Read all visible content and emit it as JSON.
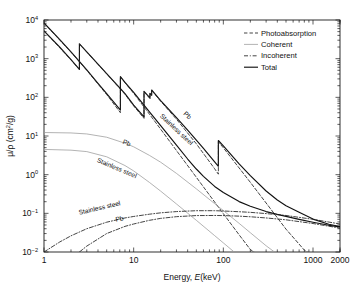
{
  "chart_data": {
    "type": "line",
    "title": "",
    "subtitle": "",
    "xlabel": "Energy, E(keV)",
    "ylabel": "μ/ρ (cm²/g)",
    "xscale": "log",
    "yscale": "log",
    "xlim": [
      1,
      2000
    ],
    "ylim": [
      0.01,
      10000
    ],
    "grid": false,
    "xticks": [
      1,
      10,
      100,
      1000,
      2000
    ],
    "xtick_labels": [
      "1",
      "10",
      "100",
      "1000",
      "2000"
    ],
    "yticks": [
      0.01,
      0.1,
      1,
      10,
      100,
      1000,
      10000
    ],
    "ytick_labels": [
      "10⁻²",
      "10⁻¹",
      "10⁰",
      "10¹",
      "10²",
      "10³",
      "10⁴"
    ],
    "legend_position": "top-right",
    "legend": [
      {
        "label": "Photoabsorption",
        "style": "dashed"
      },
      {
        "label": "Coherent",
        "style": "solid-light"
      },
      {
        "label": "Incoherent",
        "style": "dash-dot"
      },
      {
        "label": "Total",
        "style": "solid-bold"
      }
    ],
    "annotations": [
      {
        "text": "Pb",
        "series": "total-pb",
        "rotation": 42
      },
      {
        "text": "Stainless steel",
        "series": "total-ss",
        "rotation": 42
      },
      {
        "text": "Pb",
        "series": "coherent-pb",
        "rotation": 22
      },
      {
        "text": "Stainless steel",
        "series": "coherent-ss",
        "rotation": 24
      },
      {
        "text": "Stainless steel",
        "series": "incoherent-ss",
        "rotation": -14
      },
      {
        "text": "Pb",
        "series": "incoherent-pb",
        "rotation": -12
      }
    ],
    "series": [
      {
        "name": "Total Pb",
        "material": "Pb",
        "component": "Total",
        "style": "solid-bold",
        "x": [
          1,
          1.5,
          2,
          2.484,
          2.484,
          3,
          4,
          5,
          6,
          7,
          8,
          10,
          13.04,
          13.04,
          15.2,
          15.2,
          15.86,
          15.86,
          20,
          30,
          40,
          50,
          60,
          80,
          88.005,
          88.005,
          100,
          150,
          200,
          300,
          400,
          500,
          700,
          1000,
          1500,
          2000
        ],
        "y": [
          5210,
          1980,
          945,
          530,
          2420,
          1490,
          722,
          412,
          259,
          175,
          124,
          62.8,
          31.2,
          142,
          96.2,
          127,
          114,
          155,
          82.6,
          29.9,
          14.1,
          7.78,
          4.77,
          2.14,
          1.65,
          7.65,
          5.55,
          1.91,
          0.942,
          0.378,
          0.221,
          0.158,
          0.106,
          0.071,
          0.052,
          0.0457
        ]
      },
      {
        "name": "Total Stainless steel",
        "material": "Stainless steel",
        "component": "Total",
        "style": "solid-bold",
        "x": [
          1,
          1.5,
          2,
          3,
          4,
          5,
          6,
          7,
          7.112,
          7.112,
          8,
          10,
          15,
          20,
          30,
          40,
          50,
          60,
          80,
          100,
          150,
          200,
          300,
          400,
          500,
          700,
          1000,
          1500,
          2000
        ],
        "y": [
          8360,
          3120,
          1490,
          510,
          231,
          125,
          75.4,
          49.1,
          46.8,
          342,
          245,
          134,
          42.3,
          18.6,
          5.78,
          2.54,
          1.4,
          0.905,
          0.497,
          0.345,
          0.201,
          0.153,
          0.111,
          0.094,
          0.0837,
          0.07,
          0.059,
          0.049,
          0.0448
        ]
      },
      {
        "name": "Photoabsorption Pb",
        "material": "Pb",
        "component": "Photoabsorption",
        "style": "dashed",
        "x": [
          1,
          2,
          2.484,
          2.484,
          4,
          6,
          8,
          10,
          13.04,
          13.04,
          15.2,
          15.2,
          15.86,
          15.86,
          20,
          30,
          50,
          80,
          88.005,
          88.005,
          100,
          150,
          200,
          300,
          500,
          800,
          1200
        ],
        "y": [
          5190,
          935,
          520,
          2410,
          714,
          253,
          120,
          60.0,
          28.6,
          139,
          93.0,
          124,
          111,
          152,
          79.3,
          27.2,
          6.28,
          1.42,
          1.03,
          7.03,
          4.96,
          1.49,
          0.634,
          0.185,
          0.039,
          0.0112,
          0.0042
        ]
      },
      {
        "name": "Photoabsorption Stainless steel",
        "material": "Stainless steel",
        "component": "Photoabsorption",
        "style": "dashed",
        "x": [
          1,
          2,
          3,
          5,
          7.112,
          7.112,
          10,
          15,
          20,
          30,
          50,
          80,
          100,
          150,
          200,
          300,
          400,
          500
        ],
        "y": [
          8320,
          1480,
          500,
          118,
          40.1,
          336,
          127,
          36.6,
          15.0,
          4.21,
          0.855,
          0.196,
          0.098,
          0.0278,
          0.0116,
          0.0034,
          0.0014,
          0.00065
        ]
      },
      {
        "name": "Coherent Pb",
        "material": "Pb",
        "component": "Coherent",
        "style": "solid-light",
        "x": [
          1,
          2,
          3,
          5,
          8,
          10,
          15,
          20,
          30,
          50,
          80,
          100,
          150,
          200,
          300,
          500,
          800,
          1200,
          2000
        ],
        "y": [
          12.3,
          12.0,
          11.3,
          9.3,
          6.5,
          5.25,
          3.15,
          2.1,
          1.08,
          0.43,
          0.178,
          0.118,
          0.055,
          0.0315,
          0.0145,
          0.0055,
          0.0022,
          0.001,
          0.00037
        ]
      },
      {
        "name": "Coherent Stainless steel",
        "material": "Stainless steel",
        "component": "Coherent",
        "style": "solid-light",
        "x": [
          1,
          2,
          3,
          5,
          8,
          10,
          15,
          20,
          30,
          50,
          80,
          100,
          150,
          200,
          300,
          500,
          800
        ],
        "y": [
          4.5,
          4.3,
          3.95,
          2.9,
          1.72,
          1.25,
          0.63,
          0.375,
          0.175,
          0.066,
          0.0265,
          0.0172,
          0.0078,
          0.0044,
          0.002,
          0.00075,
          0.0003
        ]
      },
      {
        "name": "Incoherent Stainless steel",
        "material": "Stainless steel",
        "component": "Incoherent",
        "style": "dash-dot",
        "x": [
          1,
          1.5,
          2,
          3,
          5,
          8,
          10,
          15,
          20,
          30,
          50,
          80,
          100,
          150,
          200,
          300,
          500,
          1000,
          2000
        ],
        "y": [
          0.01,
          0.0182,
          0.0262,
          0.04,
          0.059,
          0.076,
          0.083,
          0.095,
          0.103,
          0.111,
          0.117,
          0.117,
          0.115,
          0.11,
          0.106,
          0.0985,
          0.088,
          0.07,
          0.053
        ]
      },
      {
        "name": "Incoherent Pb",
        "material": "Pb",
        "component": "Incoherent",
        "style": "dash-dot",
        "x": [
          2.484,
          3,
          5,
          8,
          10,
          15,
          20,
          30,
          50,
          80,
          100,
          150,
          200,
          300,
          500,
          1000,
          2000
        ],
        "y": [
          0.01,
          0.0142,
          0.03,
          0.046,
          0.053,
          0.066,
          0.074,
          0.082,
          0.0875,
          0.088,
          0.0875,
          0.0845,
          0.0815,
          0.076,
          0.068,
          0.0545,
          0.0415
        ]
      }
    ]
  },
  "colors": {
    "axis": "#1a1a1a",
    "total": "#111111",
    "photoabsorption": "#222222",
    "coherent": "#9a9a9a",
    "incoherent": "#222222",
    "background": "#ffffff"
  }
}
